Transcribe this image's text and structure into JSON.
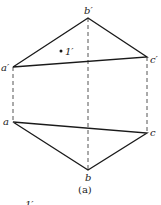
{
  "diagram": {
    "caption": "(a)",
    "colors": {
      "line": "#1a1a1a",
      "dashed": "#555555",
      "text": "#222222"
    },
    "front_view": {
      "points": {
        "a_prime": {
          "label": "a′",
          "x": 13,
          "y": 67
        },
        "b_prime": {
          "label": "b′",
          "x": 88,
          "y": 18
        },
        "c_prime": {
          "label": "c′",
          "x": 147,
          "y": 57
        }
      },
      "inner_point": {
        "label": "1′",
        "x": 61,
        "y": 51
      }
    },
    "top_view": {
      "points": {
        "a": {
          "label": "a",
          "x": 13,
          "y": 122
        },
        "b": {
          "label": "b",
          "x": 88,
          "y": 170
        },
        "c": {
          "label": "c",
          "x": 147,
          "y": 133
        }
      }
    },
    "projection_lines": [
      {
        "from": "a_prime",
        "to": "a"
      },
      {
        "from": "b_prime",
        "to": "b"
      },
      {
        "from": "c_prime",
        "to": "c"
      }
    ],
    "partial_label_bottom": "1′"
  }
}
